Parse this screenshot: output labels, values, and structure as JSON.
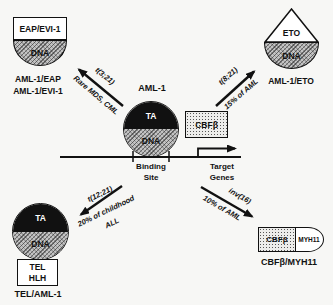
{
  "colors": {
    "background": "#f7f7f5",
    "ink": "#111111",
    "ta_fill": "#111111",
    "dna_fill": "#c3c3c3"
  },
  "center": {
    "gene_label": "AML-1",
    "ta_label": "TA",
    "dna_label": "DNA",
    "cbfb_label": "CBFβ",
    "binding_site": [
      "Binding",
      "Site"
    ],
    "target_genes": [
      "Target",
      "Genes"
    ]
  },
  "top_left": {
    "box_label": "EAP/EVI-1",
    "dna_label": "DNA",
    "fusion_names": [
      "AML-1/EAP",
      "AML-1/EVI-1"
    ],
    "arrow": {
      "translocation": "t(3;21)",
      "incidence": "Rare MDS, CML"
    }
  },
  "top_right": {
    "triangle_label": "ETO",
    "dna_label": "DNA",
    "fusion_name": "AML-1/ETO",
    "arrow": {
      "translocation": "t(8;21)",
      "incidence": "15% of AML"
    }
  },
  "bottom_left": {
    "ta_label": "TA",
    "dna_label": "DNA",
    "box_labels": [
      "TEL",
      "HLH"
    ],
    "fusion_name": "TEL/AML-1",
    "arrow": {
      "translocation": "t(12;21)",
      "incidence_lines": [
        "20% of childhood",
        "ALL"
      ]
    }
  },
  "bottom_right": {
    "cbfb_label": "CBFβ",
    "myh11_label": "MYH11",
    "fusion_name": "CBFβ/MYH11",
    "arrow": {
      "translocation": "inv(16)",
      "incidence": "10% of AML"
    }
  }
}
